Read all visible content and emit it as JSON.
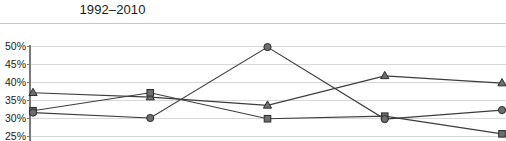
{
  "chart_title": "1992–2010",
  "axis": {
    "y_tick_labels": [
      "50%",
      "45%",
      "40%",
      "35%",
      "30%",
      "25%"
    ],
    "y_min_label": "25%",
    "y_max_label": "50%"
  },
  "colors": {
    "line": "#3c3c3c",
    "marker_fill": "#6e6e6e",
    "marker_edge": "#2b2b2b",
    "gridline": "#d8d8d8",
    "axis": "#7a7a7a",
    "rule": "#c8c8c8",
    "text": "#1a1a1a",
    "background": "#ffffff"
  },
  "chart_data": {
    "type": "line",
    "title": "1992–2010",
    "xlabel": "",
    "ylabel": "",
    "ylim": [
      25,
      50
    ],
    "yticks": [
      25,
      30,
      35,
      40,
      45,
      50
    ],
    "ytick_labels": [
      "25%",
      "30%",
      "35%",
      "40%",
      "45%",
      "50%"
    ],
    "grid": true,
    "legend": "none",
    "x": [
      1,
      2,
      3,
      4,
      5
    ],
    "series": [
      {
        "name": "series-triangle",
        "marker": "triangle",
        "values": [
          37.0,
          35.8,
          33.5,
          41.7,
          39.7
        ]
      },
      {
        "name": "series-square",
        "marker": "square",
        "values": [
          32.0,
          37.0,
          29.8,
          30.5,
          25.6
        ]
      },
      {
        "name": "series-circle",
        "marker": "circle",
        "values": [
          31.5,
          30.0,
          49.7,
          29.7,
          32.2
        ]
      }
    ]
  }
}
